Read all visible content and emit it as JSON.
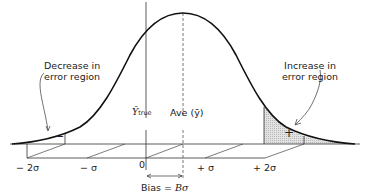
{
  "figure": {
    "left_note": {
      "line1": "Decrease in",
      "line2": "error region"
    },
    "right_note": {
      "line1": "Increase in",
      "line2": "error region"
    },
    "minus_sign": "−",
    "plus_sign": "+",
    "y_true_symbol": "Ȳ",
    "y_true_sub": "true",
    "ave_label": "Ave (ȳ)",
    "bias_label": "Bias = ",
    "bias_value": "Bσ",
    "axis_ticks": [
      "− 2σ",
      "− σ",
      "0",
      "+ σ",
      "+ 2σ"
    ]
  },
  "colors": {
    "curve": "#111111",
    "line": "#333333",
    "shade": "#d4d4d4"
  }
}
